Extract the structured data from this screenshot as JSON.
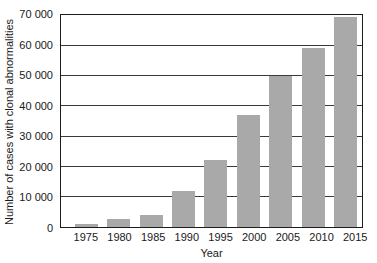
{
  "chart_data": {
    "type": "bar",
    "title": "",
    "xlabel": "Year",
    "ylabel": "Number of cases with clonal abnormalities",
    "categories": [
      "1975",
      "1980",
      "1985",
      "1990",
      "1995",
      "2000",
      "2005",
      "2010",
      "2015"
    ],
    "values": [
      1000,
      2500,
      4000,
      12000,
      22000,
      37000,
      50000,
      59000,
      69500
    ],
    "ylim": [
      0,
      70000
    ],
    "ytick_interval": 10000,
    "ytick_labels_top_down": [
      "70 000",
      "60 000",
      "50 000",
      "40 000",
      "30 000",
      "20 000",
      "10 000",
      "0"
    ],
    "grid": true,
    "legend": "none",
    "bar_color": "#a9a9a9",
    "frame_color": "#1c1c1c",
    "gridline_color": "#3a3a3a",
    "text_color": "#1a1a1a",
    "background_color": "#ffffff"
  }
}
